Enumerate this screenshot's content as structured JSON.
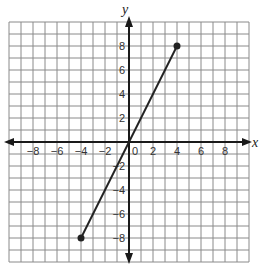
{
  "chart_data": {
    "type": "line",
    "title": "",
    "xlabel": "x",
    "ylabel": "y",
    "xlim": [
      -10,
      10
    ],
    "ylim": [
      -10,
      10
    ],
    "grid": true,
    "grid_step": 1,
    "x_tick_labels": [
      "-8",
      "-6",
      "-4",
      "-2",
      "0",
      "2",
      "4",
      "6",
      "8"
    ],
    "y_tick_labels": [
      "8",
      "6",
      "4",
      "2",
      "-2",
      "-4",
      "-6",
      "-8"
    ],
    "series": [
      {
        "name": "segment",
        "points": [
          [
            -4,
            -8
          ],
          [
            4,
            8
          ]
        ],
        "endpoints_marked": true,
        "color": "#222222"
      }
    ]
  },
  "labels": {
    "x_axis": "x",
    "y_axis": "y"
  },
  "colors": {
    "grid": "#8a8a8a",
    "axis": "#1a1a1a",
    "line": "#222222"
  }
}
